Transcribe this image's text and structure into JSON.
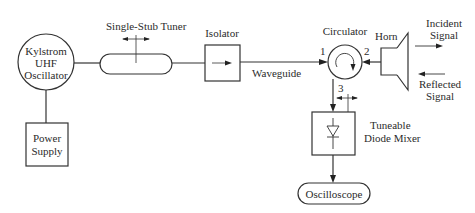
{
  "diagram": {
    "oscillator": {
      "line1": "Kylstrom",
      "line2": "UHF",
      "line3": "Oscillator"
    },
    "power_supply": {
      "line1": "Power",
      "line2": "Supply"
    },
    "stub_tuner": {
      "label": "Single-Stub Tuner"
    },
    "isolator": {
      "label": "Isolator"
    },
    "waveguide": {
      "label": "Waveguide"
    },
    "circulator": {
      "label": "Circulator",
      "port1": "1",
      "port2": "2",
      "port3": "3"
    },
    "horn": {
      "label": "Horn"
    },
    "incident": {
      "line1": "Incident",
      "line2": "Signal"
    },
    "reflected": {
      "line1": "Reflected",
      "line2": "Signal"
    },
    "mixer": {
      "line1": "Tuneable",
      "line2": "Diode Mixer"
    },
    "oscilloscope": {
      "label": "Oscilloscope"
    }
  }
}
